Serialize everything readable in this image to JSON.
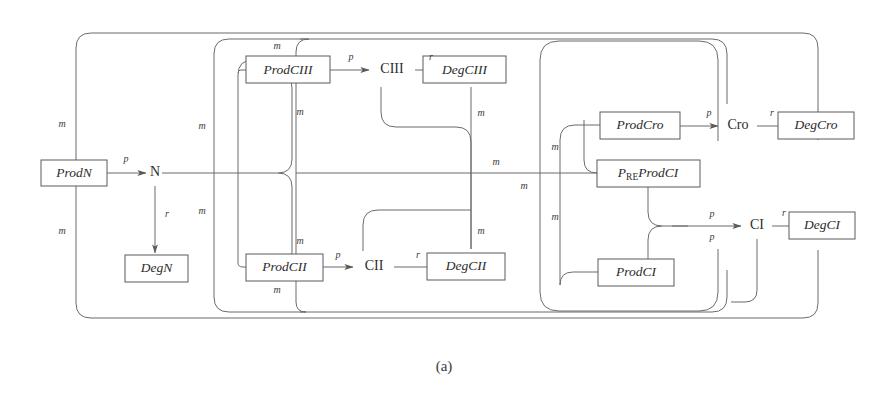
{
  "figure": {
    "caption": "(a)",
    "type": "reaction-network-diagram",
    "background_color": "#ffffff",
    "line_color": "#6b6b6b",
    "text_color": "#2c2c2c"
  },
  "boxes": {
    "prod_n": "ProdN",
    "deg_n": "DegN",
    "prod_ciii": "ProdCIII",
    "deg_ciii": "DegCIII",
    "prod_cii": "ProdCII",
    "deg_cii": "DegCII",
    "prod_cro": "ProdCro",
    "deg_cro": "DegCro",
    "pre_prod_ci_main": "ProdCI",
    "pre_prod_ci_sub": "RE",
    "pre_prod_ci_pre": "P",
    "prod_ci": "ProdCI",
    "deg_ci": "DegCI"
  },
  "species": {
    "n": "N",
    "ciii": "CIII",
    "cii": "CII",
    "cro": "Cro",
    "ci": "CI"
  },
  "edge_labels": {
    "p": "p",
    "r": "r",
    "m": "m"
  },
  "rate_labels": [
    {
      "id": "prodn-to-n",
      "text": "p"
    },
    {
      "id": "n-to-degn",
      "text": "r"
    },
    {
      "id": "prodciii-to-ciii",
      "text": "p"
    },
    {
      "id": "ciii-to-degciii",
      "text": "r"
    },
    {
      "id": "prodcii-to-cii",
      "text": "p"
    },
    {
      "id": "cii-to-degcii",
      "text": "r"
    },
    {
      "id": "prodcro-to-cro",
      "text": "p"
    },
    {
      "id": "cro-to-degcro",
      "text": "r"
    },
    {
      "id": "preprodci-to-ci",
      "text": "p"
    },
    {
      "id": "prodci-to-ci",
      "text": "p"
    },
    {
      "id": "ci-to-degci",
      "text": "r"
    }
  ],
  "modifier_labels": [
    {
      "id": "m-left-top",
      "text": "m"
    },
    {
      "id": "m-left-bottom",
      "text": "m"
    },
    {
      "id": "m-ciii-top",
      "text": "m"
    },
    {
      "id": "m-ciii-bottom",
      "text": "m"
    },
    {
      "id": "m-cii-top",
      "text": "m"
    },
    {
      "id": "m-cii-bottom",
      "text": "m"
    },
    {
      "id": "m-loop2-top",
      "text": "m"
    },
    {
      "id": "m-loop2-bottom",
      "text": "m"
    },
    {
      "id": "m-degciii-down",
      "text": "m"
    },
    {
      "id": "m-degcii-up",
      "text": "m"
    },
    {
      "id": "m-midline",
      "text": "m"
    },
    {
      "id": "m-cro-upper",
      "text": "m"
    },
    {
      "id": "m-cro-mid",
      "text": "m"
    },
    {
      "id": "m-cro-lower",
      "text": "m"
    }
  ]
}
